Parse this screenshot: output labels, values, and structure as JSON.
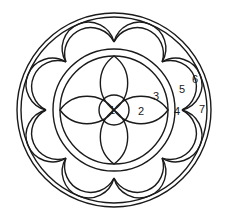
{
  "diagram": {
    "type": "rose-window-figure",
    "stroke_color": "#1a1a1a",
    "background": "#ffffff",
    "center": [
      114,
      110
    ],
    "outer_circles_r": [
      97,
      93
    ],
    "inner_ring_r": [
      61,
      54
    ],
    "center_circle_r": 15,
    "petals": {
      "count": 4,
      "length": 54,
      "half_width_angle_deg": 32
    },
    "scallops": {
      "count": 8,
      "cusp_r": 68,
      "apex_r_outer": 93,
      "apex_r_inner": 87
    },
    "labels": [
      {
        "id": "1",
        "text": "1",
        "x": 112,
        "y": 110
      },
      {
        "id": "2",
        "text": "2",
        "x": 141,
        "y": 111
      },
      {
        "id": "3",
        "text": "3",
        "x": 156,
        "y": 96
      },
      {
        "id": "4",
        "text": "4",
        "x": 177,
        "y": 111
      },
      {
        "id": "5",
        "text": "5",
        "x": 182,
        "y": 89
      },
      {
        "id": "6",
        "text": "6",
        "x": 195,
        "y": 79
      },
      {
        "id": "7",
        "text": "7",
        "x": 202,
        "y": 109
      }
    ]
  }
}
